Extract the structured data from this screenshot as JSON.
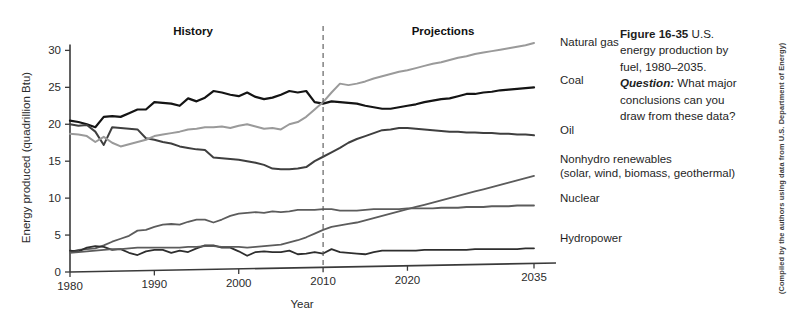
{
  "figure": {
    "caption_number": "Figure 16-35",
    "caption_body_1": " U.S. energy production by fuel, 1980–2035. ",
    "caption_question_label": "Question:",
    "caption_body_2": " What major conclusions can you draw from these data?",
    "credit": "(Compiled by the authors using data from U.S. Department of Energy)"
  },
  "annotations": {
    "history_label": "History",
    "projections_label": "Projections",
    "divider_year": 2010
  },
  "series_labels": {
    "natural_gas": "Natural gas",
    "coal": "Coal",
    "oil": "Oil",
    "nonhydro": "Nonhydro renewables",
    "nonhydro_sub": "(solar, wind, biomass, geothermal)",
    "nuclear": "Nuclear",
    "hydropower": "Hydropower"
  },
  "colors": {
    "natural_gas": "#9a9a9a",
    "coal": "#141414",
    "oil": "#3f3f3f",
    "nonhydro": "#5c5c5c",
    "nuclear": "#5c5c5c",
    "hydropower": "#2e2e2e",
    "axis": "#3a3a3a",
    "divider": "#555555"
  },
  "chart_data": {
    "type": "line",
    "xlabel": "Year",
    "ylabel": "Energy produced (quadrillion Btu)",
    "xlim": [
      1980,
      2035
    ],
    "ylim": [
      0,
      31
    ],
    "yticks": [
      0,
      5,
      10,
      15,
      20,
      25,
      30
    ],
    "xticks": [
      1980,
      1990,
      2000,
      2010,
      2020,
      2035
    ],
    "grid": false,
    "legend": "right-inline-labels",
    "x": [
      1980,
      1981,
      1982,
      1983,
      1984,
      1985,
      1986,
      1987,
      1988,
      1989,
      1990,
      1991,
      1992,
      1993,
      1994,
      1995,
      1996,
      1997,
      1998,
      1999,
      2000,
      2001,
      2002,
      2003,
      2004,
      2005,
      2006,
      2007,
      2008,
      2009,
      2010,
      2011,
      2012,
      2013,
      2014,
      2015,
      2016,
      2017,
      2018,
      2019,
      2020,
      2021,
      2022,
      2023,
      2024,
      2025,
      2026,
      2027,
      2028,
      2029,
      2030,
      2031,
      2032,
      2033,
      2034,
      2035
    ],
    "series": [
      {
        "name": "Coal",
        "color": "#141414",
        "values": [
          20.5,
          20.3,
          20.0,
          19.6,
          21.0,
          21.1,
          21.0,
          21.5,
          22.0,
          22.0,
          23.0,
          22.9,
          22.8,
          22.5,
          23.5,
          23.1,
          23.6,
          24.5,
          24.3,
          24.0,
          23.8,
          24.3,
          23.7,
          23.4,
          23.6,
          24.0,
          24.5,
          24.3,
          24.5,
          23.0,
          22.8,
          23.1,
          23.0,
          22.9,
          22.8,
          22.5,
          22.3,
          22.1,
          22.1,
          22.3,
          22.5,
          22.7,
          23.0,
          23.2,
          23.4,
          23.5,
          23.8,
          24.1,
          24.1,
          24.3,
          24.4,
          24.6,
          24.7,
          24.8,
          24.9,
          25.0
        ]
      },
      {
        "name": "Oil",
        "color": "#3f3f3f",
        "values": [
          20.0,
          19.8,
          19.9,
          19.0,
          17.2,
          19.6,
          19.5,
          19.4,
          19.3,
          18.1,
          17.9,
          17.6,
          17.4,
          17.0,
          16.8,
          16.6,
          16.5,
          15.5,
          15.4,
          15.3,
          15.2,
          15.0,
          14.8,
          14.5,
          14.0,
          13.9,
          13.9,
          14.0,
          14.2,
          15.0,
          15.6,
          16.2,
          16.8,
          17.5,
          18.0,
          18.4,
          18.8,
          19.2,
          19.3,
          19.5,
          19.5,
          19.4,
          19.3,
          19.2,
          19.1,
          19.0,
          19.0,
          18.9,
          18.9,
          18.8,
          18.8,
          18.7,
          18.7,
          18.6,
          18.6,
          18.5
        ]
      },
      {
        "name": "Natural gas",
        "color": "#9a9a9a",
        "values": [
          18.7,
          18.6,
          18.4,
          17.6,
          18.3,
          17.5,
          17.0,
          17.3,
          17.6,
          17.9,
          18.4,
          18.6,
          18.8,
          19.0,
          19.3,
          19.4,
          19.6,
          19.6,
          19.7,
          19.5,
          19.8,
          20.0,
          19.7,
          19.4,
          19.5,
          19.3,
          20.0,
          20.3,
          21.0,
          22.0,
          23.0,
          24.3,
          25.5,
          25.3,
          25.5,
          25.8,
          26.2,
          26.5,
          26.8,
          27.1,
          27.3,
          27.6,
          27.9,
          28.2,
          28.4,
          28.7,
          29.0,
          29.2,
          29.5,
          29.7,
          29.9,
          30.1,
          30.3,
          30.5,
          30.7,
          31.0
        ]
      },
      {
        "name": "Nuclear",
        "color": "#5c5c5c",
        "values": [
          2.7,
          3.0,
          3.1,
          3.2,
          3.6,
          4.1,
          4.5,
          4.9,
          5.6,
          5.7,
          6.1,
          6.4,
          6.5,
          6.4,
          6.8,
          7.1,
          7.1,
          6.7,
          7.1,
          7.6,
          7.9,
          8.0,
          8.1,
          8.0,
          8.2,
          8.1,
          8.2,
          8.4,
          8.4,
          8.4,
          8.5,
          8.5,
          8.3,
          8.3,
          8.3,
          8.4,
          8.5,
          8.5,
          8.5,
          8.5,
          8.6,
          8.6,
          8.6,
          8.6,
          8.7,
          8.7,
          8.7,
          8.8,
          8.8,
          8.8,
          8.9,
          8.9,
          8.9,
          9.0,
          9.0,
          9.0
        ]
      },
      {
        "name": "Hydropower",
        "color": "#2e2e2e",
        "values": [
          2.9,
          2.8,
          3.3,
          3.5,
          3.4,
          3.0,
          3.1,
          2.6,
          2.3,
          2.8,
          3.0,
          3.0,
          2.6,
          2.9,
          2.7,
          3.2,
          3.6,
          3.6,
          3.3,
          3.3,
          2.8,
          2.2,
          2.7,
          2.8,
          2.7,
          2.7,
          2.9,
          2.4,
          2.5,
          2.7,
          2.5,
          3.1,
          2.7,
          2.6,
          2.5,
          2.4,
          2.7,
          2.9,
          2.9,
          2.9,
          2.9,
          2.9,
          3.0,
          3.0,
          3.0,
          3.0,
          3.0,
          3.0,
          3.1,
          3.1,
          3.1,
          3.1,
          3.1,
          3.1,
          3.2,
          3.2
        ]
      },
      {
        "name": "Nonhydro renewables",
        "color": "#5c5c5c",
        "values": [
          2.6,
          2.7,
          2.8,
          2.9,
          3.0,
          3.1,
          3.1,
          3.2,
          3.3,
          3.3,
          3.3,
          3.3,
          3.3,
          3.3,
          3.4,
          3.4,
          3.5,
          3.5,
          3.4,
          3.4,
          3.4,
          3.3,
          3.4,
          3.5,
          3.6,
          3.7,
          4.0,
          4.3,
          4.7,
          5.2,
          5.7,
          6.1,
          6.3,
          6.5,
          6.7,
          7.0,
          7.3,
          7.6,
          7.9,
          8.2,
          8.5,
          8.8,
          9.1,
          9.4,
          9.7,
          10.0,
          10.3,
          10.6,
          10.9,
          11.2,
          11.5,
          11.8,
          12.1,
          12.4,
          12.7,
          13.0
        ]
      }
    ]
  }
}
